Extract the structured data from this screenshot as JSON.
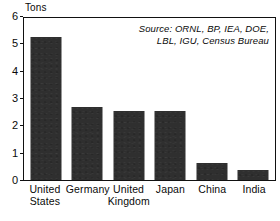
{
  "chart_data": {
    "type": "bar",
    "title": "",
    "subtitle": "",
    "xlabel": "",
    "ylabel": "Tons",
    "ylim": [
      0,
      6
    ],
    "yticks": [
      0,
      1,
      2,
      3,
      4,
      5,
      6
    ],
    "ytick_labels": [
      "0",
      "1",
      "2",
      "3",
      "4",
      "5",
      "6"
    ],
    "grid": false,
    "legend": null,
    "categories": [
      "United States",
      "Germany",
      "United Kingdom",
      "Japan",
      "China",
      "India"
    ],
    "category_lines": [
      [
        "United",
        "States"
      ],
      [
        "Germany",
        ""
      ],
      [
        "United",
        "Kingdom"
      ],
      [
        "Japan",
        ""
      ],
      [
        "China",
        ""
      ],
      [
        "India",
        ""
      ]
    ],
    "values": [
      5.28,
      2.7,
      2.55,
      2.56,
      0.63,
      0.38
    ],
    "series": [
      {
        "name": "Tons",
        "values": [
          5.28,
          2.7,
          2.55,
          2.56,
          0.63,
          0.38
        ]
      }
    ],
    "annotations": [
      {
        "name": "source-note",
        "lines": [
          "Source: ORNL, BP, IEA, DOE,",
          "LBL, IGU, Census Bureau"
        ],
        "position": "top-right",
        "style": "italic"
      }
    ],
    "colors": {
      "bar_fill": "#2f2f2f",
      "axis": "#111111",
      "background": "#ffffff",
      "text": "#0a0a0a"
    }
  }
}
